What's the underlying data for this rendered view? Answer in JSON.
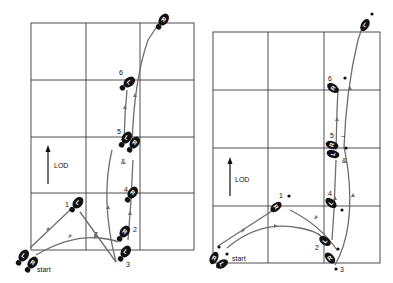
{
  "figures": [
    {
      "id": "left",
      "lod_label": "LOD",
      "start_label": "start",
      "step_labels": {
        "s1": "1",
        "s2": "2",
        "s3": "3",
        "s4": "4",
        "s5": "5",
        "s6": "6",
        "and": "&"
      },
      "footprints": [
        {
          "foot": "L",
          "step": "start"
        },
        {
          "foot": "R",
          "step": "start"
        },
        {
          "foot": "L",
          "step": "1"
        },
        {
          "foot": "R",
          "step": "2"
        },
        {
          "foot": "L",
          "step": "3"
        },
        {
          "foot": "R",
          "step": "4"
        },
        {
          "foot": "L",
          "step": "5"
        },
        {
          "foot": "R",
          "step": "&"
        },
        {
          "foot": "L",
          "step": "6"
        },
        {
          "foot": "R",
          "step": "end"
        }
      ]
    },
    {
      "id": "right",
      "lod_label": "LOD",
      "start_label": "start",
      "step_labels": {
        "s1": "1",
        "s2": "2",
        "s3": "3",
        "s4": "4",
        "s5": "5",
        "s6": "6",
        "and": "&"
      },
      "footprints": [
        {
          "foot": "R",
          "step": "start"
        },
        {
          "foot": "L",
          "step": "start"
        },
        {
          "foot": "R",
          "step": "1"
        },
        {
          "foot": "L",
          "step": "2"
        },
        {
          "foot": "R",
          "step": "3"
        },
        {
          "foot": "L",
          "step": "4"
        },
        {
          "foot": "R",
          "step": "5"
        },
        {
          "foot": "L",
          "step": "&"
        },
        {
          "foot": "R",
          "step": "6"
        },
        {
          "foot": "L",
          "step": "end"
        }
      ]
    }
  ],
  "letters": {
    "L": "L",
    "R": "R"
  }
}
